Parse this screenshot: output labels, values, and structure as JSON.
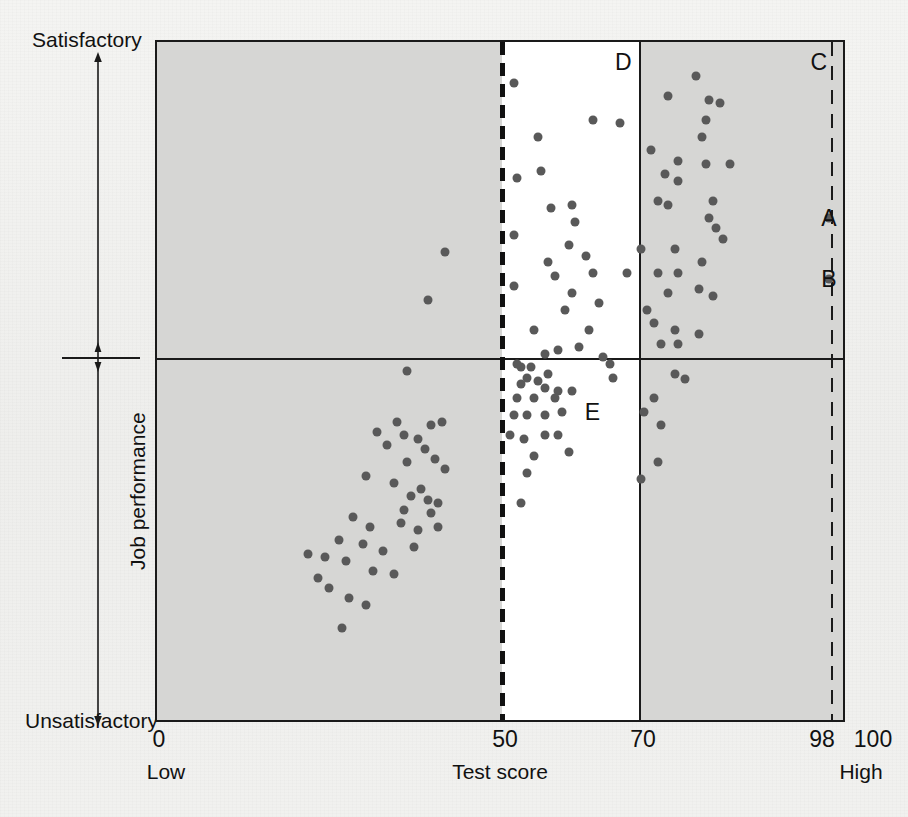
{
  "figure": {
    "background_color": "#f1f1ef",
    "plot_background_color": "#ffffff",
    "band_color": "#d6d6d4",
    "dot_color": "#595959",
    "line_color": "#1a1a1a"
  },
  "axes": {
    "y_top_label": "Satisfactory",
    "y_bottom_label": "Unsatisfactory",
    "y_title": "Job performance",
    "x_title": "Test score",
    "x_low_label": "Low",
    "x_high_label": "High",
    "x_ticks": [
      "0",
      "50",
      "70",
      "98",
      "100"
    ]
  },
  "annotations": [
    {
      "id": "A",
      "label": "A",
      "x": 98,
      "y": 74
    },
    {
      "id": "B",
      "label": "B",
      "x": 98,
      "y": 65
    },
    {
      "id": "C",
      "label": "C",
      "x": 96.5,
      "y": 97
    },
    {
      "id": "D",
      "label": "D",
      "x": 68,
      "y": 97
    },
    {
      "id": "E",
      "label": "E",
      "x": 63.5,
      "y": 45.5
    }
  ],
  "chart_data": {
    "type": "scatter",
    "title": "",
    "xlabel": "Test score",
    "ylabel": "Job performance",
    "xlim": [
      0,
      100
    ],
    "ylim": [
      0,
      100
    ],
    "grid": false,
    "legend": "none",
    "y_axis_tick_labels": [
      "Unsatisfactory",
      "Satisfactory"
    ],
    "x_axis_tick_values": [
      0,
      50,
      70,
      98,
      100
    ],
    "reference_lines": [
      {
        "name": "cut-score-50",
        "orientation": "vertical",
        "value": 50,
        "style": "dashed-thick"
      },
      {
        "name": "cut-score-70",
        "orientation": "vertical",
        "value": 70,
        "style": "solid"
      },
      {
        "name": "cut-score-98",
        "orientation": "vertical",
        "value": 98,
        "style": "dashed-thin"
      },
      {
        "name": "performance-cutoff",
        "orientation": "horizontal",
        "value": 50,
        "style": "solid"
      }
    ],
    "shaded_bands": [
      {
        "name": "band-0-50",
        "x_from": 0,
        "x_to": 50
      },
      {
        "name": "band-70-100",
        "x_from": 70,
        "x_to": 100
      }
    ],
    "points": [
      [
        42.0,
        69.0
      ],
      [
        39.5,
        62.0
      ],
      [
        36.5,
        51.5
      ],
      [
        52.0,
        94.0
      ],
      [
        52.5,
        80.0
      ],
      [
        52.0,
        71.5
      ],
      [
        52.0,
        64.0
      ],
      [
        55.5,
        86.0
      ],
      [
        56.0,
        81.0
      ],
      [
        57.5,
        75.5
      ],
      [
        57.0,
        67.5
      ],
      [
        58.0,
        65.5
      ],
      [
        59.5,
        60.5
      ],
      [
        55.0,
        57.5
      ],
      [
        56.5,
        54.0
      ],
      [
        58.5,
        54.5
      ],
      [
        54.5,
        52.0
      ],
      [
        53.0,
        52.0
      ],
      [
        52.5,
        52.5
      ],
      [
        57.0,
        51.0
      ],
      [
        54.0,
        50.5
      ],
      [
        55.5,
        50.0
      ],
      [
        53.0,
        49.5
      ],
      [
        56.5,
        49.0
      ],
      [
        58.5,
        48.5
      ],
      [
        60.5,
        76.0
      ],
      [
        61.0,
        73.5
      ],
      [
        60.0,
        70.0
      ],
      [
        62.5,
        68.5
      ],
      [
        63.5,
        66.0
      ],
      [
        60.5,
        63.0
      ],
      [
        64.5,
        61.5
      ],
      [
        63.0,
        57.5
      ],
      [
        61.5,
        55.0
      ],
      [
        65.0,
        53.5
      ],
      [
        66.0,
        52.5
      ],
      [
        66.5,
        50.5
      ],
      [
        63.5,
        88.5
      ],
      [
        67.5,
        88.0
      ],
      [
        68.5,
        66.0
      ],
      [
        74.5,
        92.0
      ],
      [
        78.5,
        95.0
      ],
      [
        80.5,
        91.5
      ],
      [
        82.0,
        91.0
      ],
      [
        80.0,
        88.5
      ],
      [
        79.5,
        86.0
      ],
      [
        72.0,
        84.0
      ],
      [
        76.0,
        82.5
      ],
      [
        80.0,
        82.0
      ],
      [
        83.5,
        82.0
      ],
      [
        74.0,
        80.5
      ],
      [
        76.0,
        79.5
      ],
      [
        73.0,
        76.5
      ],
      [
        74.5,
        76.0
      ],
      [
        81.0,
        76.5
      ],
      [
        80.5,
        74.0
      ],
      [
        81.5,
        72.5
      ],
      [
        82.5,
        71.0
      ],
      [
        70.5,
        69.5
      ],
      [
        75.5,
        69.5
      ],
      [
        79.5,
        67.5
      ],
      [
        73.0,
        66.0
      ],
      [
        76.0,
        66.0
      ],
      [
        74.5,
        63.0
      ],
      [
        79.0,
        63.5
      ],
      [
        81.0,
        62.5
      ],
      [
        71.5,
        60.5
      ],
      [
        72.5,
        58.5
      ],
      [
        75.5,
        57.5
      ],
      [
        79.0,
        57.0
      ],
      [
        73.5,
        55.5
      ],
      [
        76.0,
        55.5
      ],
      [
        75.5,
        51.0
      ],
      [
        77.0,
        50.3
      ],
      [
        98.0,
        74.0
      ],
      [
        98.0,
        65.0
      ],
      [
        35.0,
        44.0
      ],
      [
        32.0,
        42.5
      ],
      [
        36.0,
        42.0
      ],
      [
        33.5,
        40.5
      ],
      [
        38.0,
        41.5
      ],
      [
        40.0,
        43.5
      ],
      [
        41.5,
        44.0
      ],
      [
        39.0,
        40.0
      ],
      [
        36.5,
        38.0
      ],
      [
        40.5,
        38.5
      ],
      [
        42.0,
        37.0
      ],
      [
        30.5,
        36.0
      ],
      [
        34.5,
        35.0
      ],
      [
        38.5,
        34.0
      ],
      [
        37.0,
        33.0
      ],
      [
        39.5,
        32.5
      ],
      [
        41.0,
        32.0
      ],
      [
        36.0,
        31.0
      ],
      [
        40.0,
        30.5
      ],
      [
        28.5,
        30.0
      ],
      [
        31.0,
        28.5
      ],
      [
        35.5,
        29.0
      ],
      [
        38.0,
        28.0
      ],
      [
        41.0,
        28.5
      ],
      [
        26.5,
        26.5
      ],
      [
        30.0,
        26.0
      ],
      [
        33.0,
        25.0
      ],
      [
        37.5,
        25.5
      ],
      [
        24.5,
        24.0
      ],
      [
        27.5,
        23.5
      ],
      [
        31.5,
        22.0
      ],
      [
        34.5,
        21.5
      ],
      [
        25.0,
        19.5
      ],
      [
        28.0,
        18.0
      ],
      [
        30.5,
        17.0
      ],
      [
        27.0,
        13.5
      ],
      [
        22.0,
        24.5
      ],
      [
        23.5,
        21.0
      ],
      [
        52.5,
        47.5
      ],
      [
        55.0,
        47.5
      ],
      [
        58.0,
        47.5
      ],
      [
        60.5,
        48.5
      ],
      [
        52.0,
        45.0
      ],
      [
        54.0,
        45.0
      ],
      [
        56.5,
        45.0
      ],
      [
        59.0,
        45.5
      ],
      [
        51.5,
        42.0
      ],
      [
        53.5,
        41.5
      ],
      [
        56.5,
        42.0
      ],
      [
        58.5,
        42.0
      ],
      [
        55.0,
        39.0
      ],
      [
        60.0,
        39.5
      ],
      [
        54.0,
        36.5
      ],
      [
        53.0,
        32.0
      ],
      [
        72.5,
        47.5
      ],
      [
        71.0,
        45.5
      ],
      [
        73.5,
        43.5
      ],
      [
        73.0,
        38.0
      ],
      [
        70.5,
        35.5
      ]
    ]
  }
}
